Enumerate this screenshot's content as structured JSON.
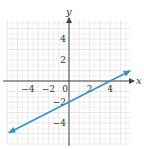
{
  "chart_data": {
    "type": "line",
    "title": "",
    "xlabel": "x",
    "ylabel": "y",
    "xlim": [
      -6,
      6
    ],
    "ylim": [
      -6,
      6
    ],
    "grid": true,
    "x_ticks": [
      {
        "value": -4,
        "label": "−4"
      },
      {
        "value": -2,
        "label": "−2"
      },
      {
        "value": 0,
        "label": "0"
      },
      {
        "value": 2,
        "label": "2"
      },
      {
        "value": 4,
        "label": "4"
      }
    ],
    "y_ticks": [
      {
        "value": 4,
        "label": "4"
      },
      {
        "value": 2,
        "label": "2"
      },
      {
        "value": -2,
        "label": "−2"
      },
      {
        "value": -4,
        "label": "−4"
      }
    ],
    "series": [
      {
        "name": "line",
        "equation": "y = 0.5x − 2",
        "x": [
          -5.8,
          0,
          4,
          5.9
        ],
        "y": [
          -4.9,
          -2,
          0,
          0.95
        ],
        "color": "#3a8fc8",
        "arrows": "both"
      }
    ]
  },
  "colors": {
    "grid": "#d9d9d9",
    "axis": "#444444",
    "line": "#3a8fc8"
  }
}
